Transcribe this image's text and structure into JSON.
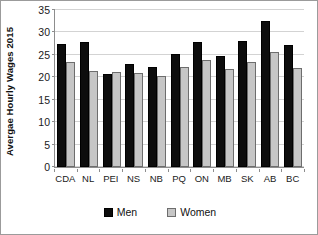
{
  "chart_data": {
    "type": "bar",
    "title": "",
    "subtitle": "",
    "xlabel": "",
    "ylabel": "Avergae Hourly  Wages 2015",
    "ylim": [
      0,
      35
    ],
    "ytick_values": [
      0,
      5,
      10,
      15,
      20,
      25,
      30,
      35
    ],
    "ytick_labels": [
      "0",
      "5",
      "10",
      "15",
      "20",
      "25",
      "30",
      "35"
    ],
    "grid": true,
    "legend_position": "bottom",
    "categories": [
      "CDA",
      "NL",
      "PEI",
      "NS",
      "NB",
      "PQ",
      "ON",
      "MB",
      "SK",
      "AB",
      "BC"
    ],
    "series": [
      {
        "name": "Men",
        "color": "#0d0d0d",
        "values": [
          27.5,
          27.8,
          20.8,
          22.9,
          22.4,
          25.2,
          27.9,
          24.8,
          28.1,
          32.6,
          27.1
        ]
      },
      {
        "name": "Women",
        "color": "#c6c6c6",
        "values": [
          23.3,
          21.5,
          21.1,
          20.9,
          20.2,
          22.4,
          23.8,
          21.9,
          23.5,
          25.7,
          22.0
        ]
      }
    ]
  },
  "legend": {
    "entries": [
      {
        "label": "Men",
        "swatch": "men-swatch"
      },
      {
        "label": "Women",
        "swatch": "women-swatch"
      }
    ]
  }
}
